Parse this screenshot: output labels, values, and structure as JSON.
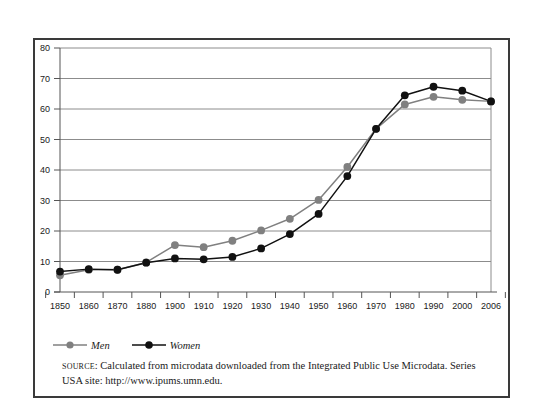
{
  "chart_data": {
    "type": "line",
    "title": "",
    "subtitle": "",
    "xlabel": "",
    "ylabel": "",
    "categories": [
      "1850",
      "1860",
      "1870",
      "1880",
      "1900",
      "1910",
      "1920",
      "1930",
      "1940",
      "1950",
      "1960",
      "1970",
      "1980",
      "1990",
      "2000",
      "2006"
    ],
    "series": [
      {
        "name": "Men",
        "color": "#808080",
        "marker": "circle",
        "values": [
          5.5,
          7.3,
          7.3,
          9.7,
          15.4,
          14.7,
          16.8,
          20.2,
          24.0,
          30.2,
          41.0,
          53.5,
          61.5,
          64.0,
          63.0,
          62.5
        ]
      },
      {
        "name": "Women",
        "color": "#111111",
        "marker": "circle",
        "values": [
          6.7,
          7.5,
          7.3,
          9.6,
          11.0,
          10.7,
          11.5,
          14.3,
          19.0,
          25.6,
          38.0,
          53.5,
          64.5,
          67.3,
          66.0,
          62.5
        ]
      }
    ],
    "ylim": [
      0,
      80
    ],
    "yticks": [
      0,
      10,
      20,
      30,
      40,
      50,
      60,
      70,
      80
    ],
    "ytick_labels": [
      "0",
      "10",
      "20",
      "30",
      "40",
      "50",
      "60",
      "70",
      "80"
    ],
    "grid": "horizontal",
    "legend_position": "below-left"
  },
  "legend": {
    "entries": [
      {
        "label": "Men",
        "color": "#808080"
      },
      {
        "label": "Women",
        "color": "#111111"
      }
    ]
  },
  "source": {
    "prefix": "SOURCE",
    "line1": ": Calculated from microdata downloaded from the Integrated Public Use Microdata.",
    "line2": "Series USA site: http://www.ipums.umn.edu."
  },
  "colors": {
    "men": "#808080",
    "women": "#111111",
    "grid": "#8c8c8c",
    "axis": "#555555",
    "frame": "#3a3a3a",
    "text": "#1a1a1a"
  }
}
